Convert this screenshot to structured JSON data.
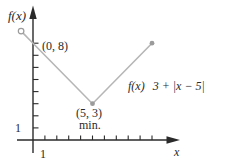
{
  "chart_data": {
    "type": "line",
    "xlabel": "x",
    "ylabel": "f(x)",
    "formula": {
      "f": "f(x)",
      "rest": "3 + |x − 5|"
    },
    "x_ticks": [
      1,
      2,
      3,
      4,
      5,
      6,
      7,
      8,
      9,
      10
    ],
    "y_ticks": [
      1,
      2,
      3,
      4,
      5,
      6,
      7,
      8
    ],
    "shown_tick_labels": {
      "x": "1",
      "y": "1"
    },
    "xlim": [
      -1.5,
      12.5
    ],
    "ylim": [
      0,
      11
    ],
    "grid": false,
    "legend": false,
    "series": [
      {
        "name": "f(x) 3 + |x − 5|",
        "color": "#b6b6b6",
        "points": [
          {
            "x": -1,
            "y": 9,
            "marker": "open-circle"
          },
          {
            "x": 0,
            "y": 8,
            "marker": "none"
          },
          {
            "x": 5,
            "y": 3,
            "marker": "dot"
          },
          {
            "x": 10,
            "y": 8,
            "marker": "dot"
          }
        ]
      }
    ],
    "annotations": [
      {
        "text": "(0, 8)",
        "x": 0,
        "y": 8
      },
      {
        "text": "(5, 3)",
        "x": 5,
        "y": 3
      },
      {
        "text": "min.",
        "x": 5,
        "y": 3
      }
    ]
  },
  "colors": {
    "background": "#ffffff",
    "axis": "#2a2a2a",
    "text": "#2a2a2a",
    "curve": "#b6b6b6",
    "marker": "#9b9b9b"
  }
}
